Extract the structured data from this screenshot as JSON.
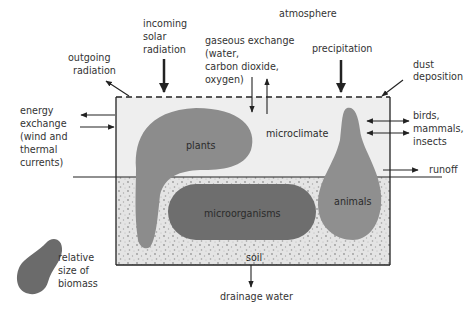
{
  "diagram": {
    "title": "atmosphere",
    "colors": {
      "microclimate_fill": "#eeeeee",
      "soil_fill": "#e4e4e4",
      "soil_dots": "#9a9a9a",
      "plants": "#8c8c8c",
      "animals": "#8f8f8f",
      "microorganisms": "#6e6e6e",
      "legend_blob": "#6b6b6b",
      "line": "#222222"
    },
    "labels": {
      "atmosphere": "atmosphere",
      "incoming_solar": [
        "incoming",
        "solar",
        "radiation"
      ],
      "outgoing_radiation": [
        "outgoing",
        "radiation"
      ],
      "gaseous_exchange": [
        "gaseous exchange",
        "(water,",
        "carbon dioxide,",
        "oxygen)"
      ],
      "precipitation": "precipitation",
      "dust_deposition": [
        "dust",
        "deposition"
      ],
      "energy_exchange": [
        "energy",
        "exchange",
        "(wind and",
        "thermal",
        "currents)"
      ],
      "birds_mammals_insects": [
        "birds,",
        "mammals,",
        "insects"
      ],
      "runoff": "runoff",
      "drainage_water": "drainage water",
      "microclimate": "microclimate",
      "soil": "soil",
      "plants": "plants",
      "animals": "animals",
      "microorganisms": "microorganisms",
      "legend": [
        "relative",
        "size of",
        "biomass"
      ]
    }
  }
}
